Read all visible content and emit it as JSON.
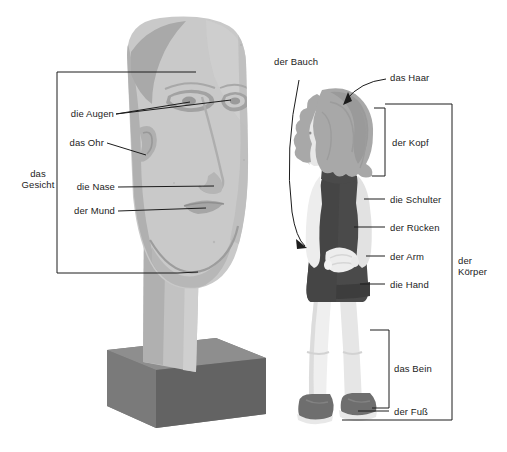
{
  "diagram": {
    "language": "de",
    "colors": {
      "background": "#ffffff",
      "text": "#1c1c1c",
      "leader_line": "#1c1c1c",
      "statue_light": "#c9c9c9",
      "statue_mid": "#b4b4b4",
      "statue_shadow": "#9c9c9c",
      "statue_dark": "#8b8b8b",
      "pedestal_top": "#8e8e8e",
      "pedestal_front": "#7d7d7d",
      "pedestal_side": "#636363",
      "hair": "#a8a8a8",
      "hair_dark": "#9a9a9a",
      "skin": "#e2e2e2",
      "skin_shade": "#d2d2d2",
      "dress": "#4a4a4a",
      "dress_band": "#3d3d3d",
      "shirt": "#ededed",
      "tights": "#efefef",
      "tights_shade": "#dcdcdc",
      "shoe": "#6e6e6e",
      "shoe_sole": "#e8e8e8"
    },
    "figures": [
      {
        "name": "sculpture-head",
        "side": "left",
        "description": "stylized stone head on pedestal"
      },
      {
        "name": "girl-figure",
        "side": "right",
        "description": "girl standing, seen from behind"
      }
    ],
    "labels": {
      "face_bracket": "das\nGesicht",
      "eyes": "die Augen",
      "ear": "das Ohr",
      "nose": "die Nase",
      "mouth": "der Mund",
      "belly": "der Bauch",
      "hair": "das Haar",
      "head_bracket": "der Kopf",
      "shoulder": "die Schulter",
      "back": "der Rücken",
      "arm": "der Arm",
      "hand": "die Hand",
      "body_bracket": "der\nKörper",
      "leg_bracket": "das Bein",
      "foot": "der Fuß"
    },
    "label_list": [
      "das Gesicht",
      "die Augen",
      "das Ohr",
      "die Nase",
      "der Mund",
      "der Bauch",
      "das Haar",
      "der Kopf",
      "die Schulter",
      "der Rücken",
      "der Arm",
      "die Hand",
      "der Körper",
      "das Bein",
      "der Fuß"
    ]
  }
}
